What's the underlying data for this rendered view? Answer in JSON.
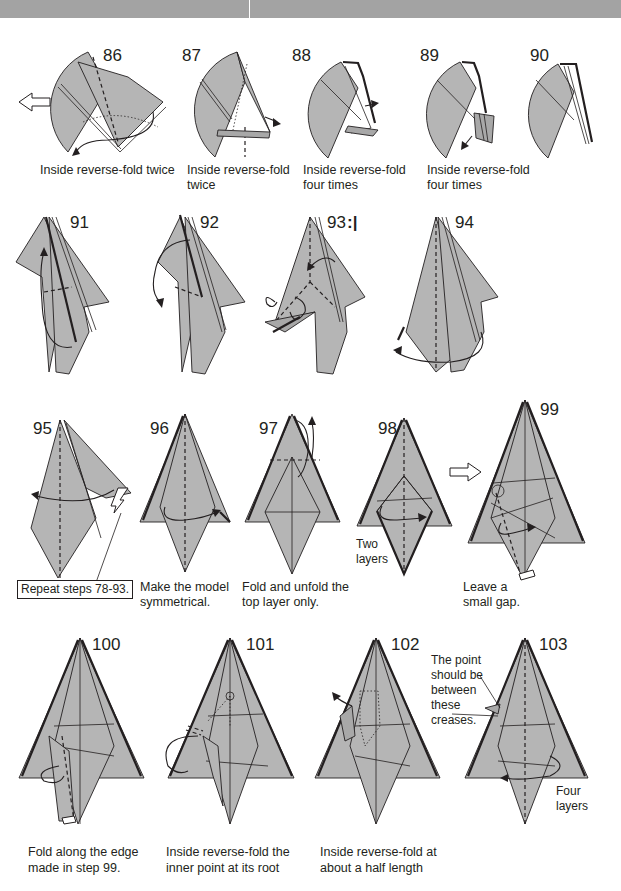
{
  "header": {
    "bar_color": "#a3a3a3"
  },
  "rows": [
    {
      "steps": [
        {
          "number": "86",
          "caption": [
            "Inside reverse-fold twice"
          ],
          "symbol": "hollow-arrow-icon"
        },
        {
          "number": "87",
          "caption": [
            "Inside reverse-fold",
            "twice"
          ]
        },
        {
          "number": "88",
          "caption": [
            "Inside reverse-fold",
            "four times"
          ]
        },
        {
          "number": "89",
          "caption": [
            "Inside reverse-fold",
            "four times"
          ]
        },
        {
          "number": "90",
          "caption": []
        }
      ]
    },
    {
      "steps": [
        {
          "number": "91",
          "caption": []
        },
        {
          "number": "92",
          "caption": []
        },
        {
          "number": "93",
          "caption": [],
          "symbol": "repeat-mark-icon",
          "symbol_text": ":|"
        },
        {
          "number": "94",
          "caption": []
        }
      ]
    },
    {
      "steps": [
        {
          "number": "95",
          "caption": [],
          "note_boxed": "Repeat steps 78-93."
        },
        {
          "number": "96",
          "caption": [
            "Make the model",
            "symmetrical."
          ]
        },
        {
          "number": "97",
          "caption": [
            "Fold and unfold the",
            "top layer only."
          ]
        },
        {
          "number": "98",
          "caption": [],
          "note": [
            "Two",
            "layers"
          ]
        },
        {
          "number": "99",
          "caption": [
            "Leave a",
            "small gap."
          ],
          "symbol": "hollow-arrow-icon"
        }
      ]
    },
    {
      "steps": [
        {
          "number": "100",
          "caption": [
            "Fold along the edge",
            "made in step 99."
          ]
        },
        {
          "number": "101",
          "caption": [
            "Inside reverse-fold the",
            "inner point at its root"
          ]
        },
        {
          "number": "102",
          "caption": [
            "Inside reverse-fold at",
            "about a half length"
          ]
        },
        {
          "number": "103",
          "caption": [],
          "note": [
            "The point",
            "should be",
            "between",
            "these",
            "creases."
          ],
          "note2": [
            "Four",
            "layers"
          ]
        }
      ]
    }
  ],
  "colors": {
    "paper": "#b5b5b5",
    "ink": "#231f20",
    "background": "#ffffff"
  }
}
